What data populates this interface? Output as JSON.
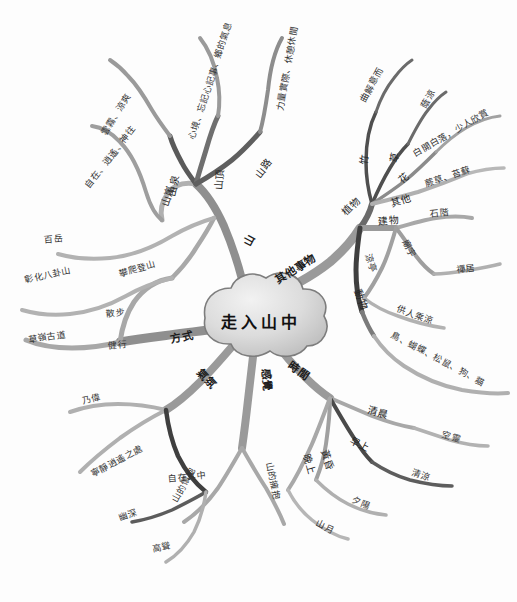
{
  "title": "走入山中",
  "center": {
    "label": "走入山中"
  },
  "colors": {
    "branch_dark": "#4a4a4a",
    "branch_mid": "#8d8d8d",
    "branch_light": "#b5b5b5",
    "text": "#2b2b2b",
    "cloud_fill": "#d9d9d9",
    "background": "#ffffff"
  },
  "branches": [
    {
      "id": "shan",
      "label": "山",
      "children": [
        {
          "label": "山嵐",
          "children": [
            {
              "label": "自在、逍遙、神往"
            }
          ]
        },
        {
          "label": "山泉",
          "children": [
            {
              "label": "雲霧、涼爽"
            }
          ]
        },
        {
          "label": "山頂",
          "children": [
            {
              "label": "心境、忘記心記事、鄉的氣息"
            }
          ]
        },
        {
          "label": "山路",
          "children": [
            {
              "label": "力量實際、休憩休閒"
            }
          ]
        }
      ]
    },
    {
      "id": "qita",
      "label": "其他事物",
      "children": [
        {
          "label": "植物",
          "children": [
            {
              "label": "竹",
              "children": [
                {
                  "label": "曲解意而"
                }
              ]
            },
            {
              "label": "草",
              "children": [
                {
                  "label": "蔭涼"
                }
              ]
            },
            {
              "label": "花",
              "children": [
                {
                  "label": "白開白落，少人欣賞"
                }
              ]
            },
            {
              "label": "其他",
              "children": [
                {
                  "label": "蕨草、苔蘚"
                }
              ]
            }
          ]
        },
        {
          "label": "建物",
          "children": [
            {
              "label": "石階"
            },
            {
              "label": "廟宇",
              "children": [
                {
                  "label": "禪居"
                }
              ]
            },
            {
              "label": "涼亭",
              "children": [
                {
                  "label": "供人乘涼"
                }
              ]
            }
          ]
        },
        {
          "label": "動物",
          "children": [
            {
              "label": "鳥、蝴蝶、松鼠、狗、貓"
            }
          ]
        }
      ]
    },
    {
      "id": "shijian",
      "label": "時間",
      "children": [
        {
          "label": "清晨",
          "children": [
            {
              "label": "空靈"
            }
          ]
        },
        {
          "label": "早上",
          "children": [
            {
              "label": "清涼"
            }
          ]
        },
        {
          "label": "黃昏",
          "children": [
            {
              "label": "夕陽"
            }
          ]
        },
        {
          "label": "晚上",
          "children": [
            {
              "label": "山月"
            }
          ]
        }
      ]
    },
    {
      "id": "ganjue",
      "label": "感覺",
      "children": [
        {
          "label": "山的擁抱"
        },
        {
          "label": "山的懷抱"
        }
      ]
    },
    {
      "id": "qifen",
      "label": "氣氛",
      "children": [
        {
          "label": "乃偉"
        },
        {
          "label": "寧靜逍遙之處"
        },
        {
          "label": "自在其中",
          "children": [
            {
              "label": "幽深"
            },
            {
              "label": "高聳"
            }
          ]
        }
      ]
    },
    {
      "id": "fangshi",
      "label": "方式",
      "children": [
        {
          "label": "百岳"
        },
        {
          "label": "彰化八卦山"
        },
        {
          "label": "攀爬登山"
        },
        {
          "label": "散步"
        },
        {
          "label": "健行"
        },
        {
          "label": "草嶺古道"
        }
      ]
    }
  ]
}
